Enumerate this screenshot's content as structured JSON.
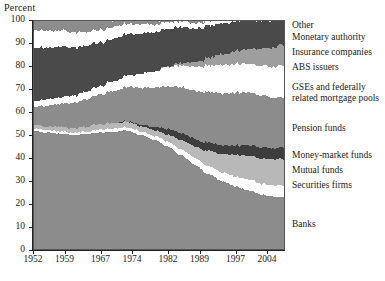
{
  "axis": {
    "ylabel": "Percent",
    "yticks": [
      0,
      10,
      20,
      30,
      40,
      50,
      60,
      70,
      80,
      90,
      100
    ],
    "xticks": [
      1952,
      1959,
      1967,
      1974,
      1982,
      1989,
      1997,
      2004
    ]
  },
  "legend": [
    {
      "key": "other",
      "label": "Other",
      "y": 20
    },
    {
      "key": "monetary_authority",
      "label": "Monetary authority",
      "y": 32
    },
    {
      "key": "insurance_companies",
      "label": "Insurance companies",
      "y": 47
    },
    {
      "key": "abs_issuers",
      "label": "ABS issuers",
      "y": 62
    },
    {
      "key": "gses",
      "label": "GSEs and federally",
      "y": 82
    },
    {
      "key": "gses2",
      "label": "related mortgage pools",
      "y": 93
    },
    {
      "key": "pension_funds",
      "label": "Pension funds",
      "y": 123
    },
    {
      "key": "money_market_funds",
      "label": "Money-market funds",
      "y": 150
    },
    {
      "key": "mutual_funds",
      "label": "Mutual funds",
      "y": 165
    },
    {
      "key": "securities_firms",
      "label": "Securities firms",
      "y": 180
    },
    {
      "key": "banks",
      "label": "Banks",
      "y": 219
    }
  ],
  "colors": {
    "banks": "#8c8c8c",
    "securities_firms": "#ffffff",
    "mutual_funds": "#b8b8b8",
    "money_market_funds": "#3d3d3d",
    "pension_funds": "#8c8c8c",
    "gses": "#ffffff",
    "abs_issuers": "#9e9e9e",
    "insurance_companies": "#4a4a4a",
    "monetary_authority": "#ffffff",
    "other": "#8c8c8c",
    "axis": "#222222",
    "frame": "#555555"
  },
  "chart_data": {
    "type": "area",
    "title": "",
    "xlabel": "",
    "ylabel": "Percent",
    "ylim": [
      0,
      100
    ],
    "xlim": [
      1952,
      2008
    ],
    "grid": false,
    "stacked": true,
    "legend_position": "right",
    "x": [
      1952,
      1955,
      1958,
      1961,
      1964,
      1967,
      1970,
      1973,
      1976,
      1979,
      1982,
      1985,
      1988,
      1991,
      1994,
      1997,
      2000,
      2003,
      2006,
      2008
    ],
    "series": [
      {
        "name": "Banks",
        "values": [
          52.0,
          51.0,
          50.5,
          50.0,
          50.5,
          51.0,
          51.5,
          52.0,
          50.0,
          48.0,
          45.0,
          41.0,
          37.0,
          33.0,
          30.0,
          27.5,
          26.0,
          24.0,
          23.0,
          23.0
        ]
      },
      {
        "name": "Securities firms",
        "values": [
          1.0,
          1.0,
          1.0,
          1.0,
          1.0,
          1.2,
          1.3,
          1.4,
          1.6,
          1.8,
          2.2,
          2.6,
          3.0,
          3.4,
          3.8,
          4.2,
          4.6,
          4.8,
          5.0,
          5.2
        ]
      },
      {
        "name": "Mutual funds",
        "values": [
          1.5,
          1.6,
          1.8,
          2.0,
          2.2,
          2.4,
          2.4,
          2.3,
          2.2,
          2.4,
          3.0,
          4.0,
          5.0,
          6.5,
          8.0,
          9.5,
          10.5,
          11.0,
          11.5,
          11.5
        ]
      },
      {
        "name": "Money-market funds",
        "values": [
          0.0,
          0.0,
          0.0,
          0.0,
          0.0,
          0.0,
          0.0,
          0.2,
          0.6,
          1.4,
          2.6,
          3.0,
          3.2,
          3.6,
          3.8,
          4.0,
          4.5,
          4.8,
          4.6,
          5.0
        ]
      },
      {
        "name": "Pension funds",
        "values": [
          8.0,
          9.0,
          10.0,
          11.0,
          12.0,
          13.0,
          14.0,
          15.0,
          16.0,
          17.0,
          18.5,
          20.0,
          21.0,
          22.0,
          22.5,
          23.0,
          23.0,
          22.5,
          22.0,
          21.5
        ]
      },
      {
        "name": "GSEs and federally related mortgage pools",
        "values": [
          2.5,
          2.6,
          2.8,
          3.0,
          3.2,
          3.6,
          4.2,
          5.0,
          6.0,
          7.0,
          8.5,
          9.5,
          10.5,
          11.5,
          12.5,
          12.5,
          12.5,
          13.0,
          13.5,
          14.0
        ]
      },
      {
        "name": "ABS issuers",
        "values": [
          0.0,
          0.0,
          0.0,
          0.0,
          0.0,
          0.0,
          0.0,
          0.0,
          0.0,
          0.0,
          0.3,
          1.0,
          2.0,
          3.2,
          4.5,
          5.5,
          6.5,
          7.5,
          8.5,
          9.0
        ]
      },
      {
        "name": "Insurance companies",
        "values": [
          23.0,
          22.5,
          22.0,
          21.0,
          20.0,
          19.0,
          18.5,
          18.0,
          17.5,
          17.0,
          16.5,
          15.5,
          14.5,
          14.0,
          13.5,
          13.0,
          12.5,
          12.0,
          11.5,
          11.0
        ]
      },
      {
        "name": "Monetary authority",
        "values": [
          8.0,
          7.5,
          7.0,
          6.5,
          6.0,
          5.5,
          5.0,
          4.5,
          4.0,
          3.5,
          3.0,
          2.5,
          2.3,
          2.1,
          2.0,
          1.9,
          1.8,
          1.8,
          1.8,
          1.8
        ]
      },
      {
        "name": "Other",
        "values": [
          4.0,
          4.8,
          4.9,
          5.5,
          5.1,
          4.3,
          2.6,
          1.6,
          2.1,
          1.9,
          0.4,
          0.9,
          1.5,
          0.7,
          1.4,
          0.9,
          1.1,
          1.6,
          1.6,
          1.0
        ]
      }
    ]
  }
}
